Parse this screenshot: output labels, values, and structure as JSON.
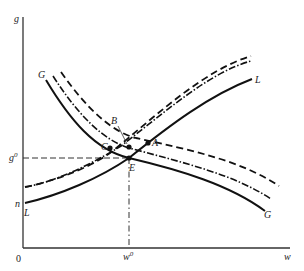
{
  "figure": {
    "type": "economics-curve-diagram",
    "axes": {
      "y_label": "g",
      "x_label": "w",
      "origin_label": "0",
      "x_ref_label": "w",
      "x_ref_superscript": "0",
      "y_ref_label": "g",
      "y_ref_superscript": "0",
      "y_intercept_label": "n"
    },
    "curves": [
      {
        "name": "G",
        "style": "solid",
        "label_start": "G",
        "label_end": "G"
      },
      {
        "name": "G-dashdot",
        "style": "dash-dot"
      },
      {
        "name": "G-dashed",
        "style": "dashed"
      },
      {
        "name": "L",
        "style": "solid",
        "label_start": "L",
        "label_end": "L"
      },
      {
        "name": "L-dashdot",
        "style": "dash-dot"
      },
      {
        "name": "L-dashed",
        "style": "dashed"
      }
    ],
    "points": [
      {
        "label": "A"
      },
      {
        "label": "B"
      },
      {
        "label": "C"
      },
      {
        "label": "E"
      }
    ],
    "colors": {
      "ink": "#1a1a1a",
      "background": "#ffffff"
    }
  }
}
